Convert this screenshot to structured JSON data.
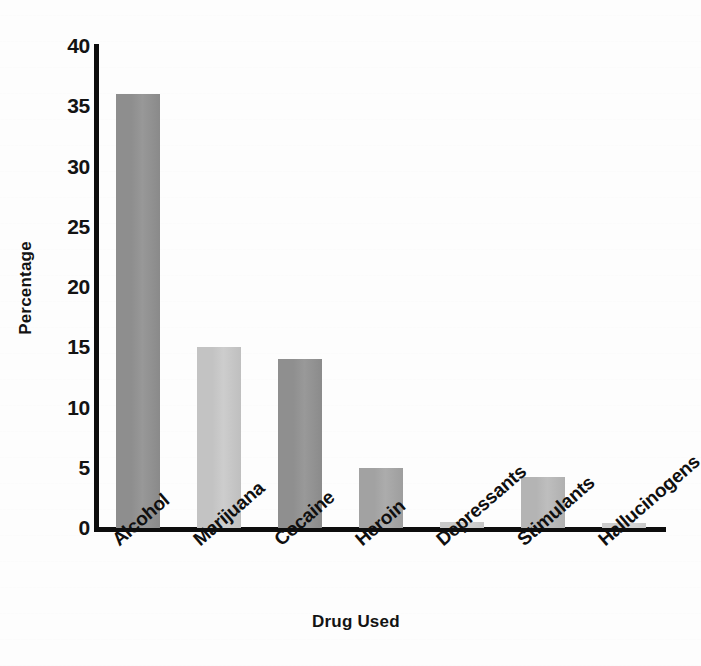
{
  "chart_data": {
    "type": "bar",
    "title": "",
    "subtitle": "",
    "xlabel": "Drug Used",
    "ylabel": "Percentage",
    "categories": [
      "Alcohol",
      "Marijuana",
      "Cocaine",
      "Heroin",
      "Depressants",
      "Stimulants",
      "Hallucinogens"
    ],
    "values": [
      36,
      15,
      14,
      5,
      0.5,
      4.2,
      0.4
    ],
    "ylim": [
      0,
      40
    ],
    "yticks": [
      0,
      5,
      10,
      15,
      20,
      25,
      30,
      35,
      40
    ],
    "ytick_labels": [
      "0",
      "5",
      "10",
      "15",
      "20",
      "25",
      "30",
      "35",
      "40"
    ],
    "grid": false,
    "legend": null,
    "bar_colors": [
      "#8e8e8e",
      "#c3c3c3",
      "#8f8f8f",
      "#a2a2a2",
      "#c9c9c9",
      "#b4b4b4",
      "#cccccc"
    ],
    "axis_color": "#0d0d0d",
    "text_color": "#131313",
    "background_color": "#fdfdfd",
    "xtick_rotation": -41
  }
}
